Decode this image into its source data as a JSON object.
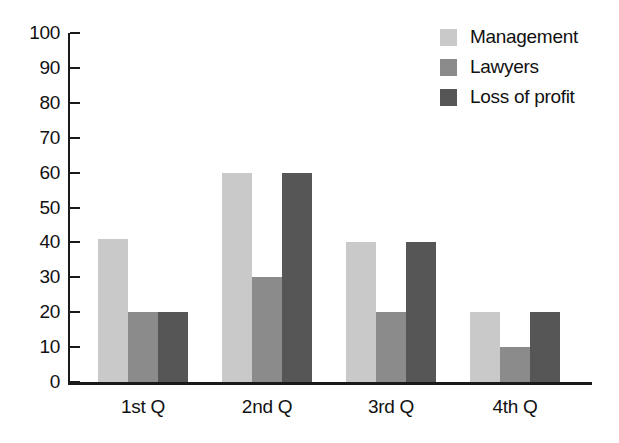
{
  "chart_data": {
    "type": "bar",
    "title": "",
    "subtitle": "",
    "xlabel": "",
    "ylabel": "",
    "categories": [
      "1st Q",
      "2nd Q",
      "3rd Q",
      "4th Q"
    ],
    "series": [
      {
        "name": "Management",
        "color": "#c9c9c9",
        "values": [
          41,
          60,
          40,
          20
        ]
      },
      {
        "name": "Lawyers",
        "color": "#8b8b8b",
        "values": [
          20,
          30,
          20,
          10
        ]
      },
      {
        "name": "Loss of profit",
        "color": "#565656",
        "values": [
          20,
          60,
          40,
          20
        ]
      }
    ],
    "ylim": [
      0,
      100
    ],
    "ytick_labels": [
      "100",
      "90",
      "80",
      "70",
      "60",
      "50",
      "40",
      "30",
      "20",
      "10",
      "0"
    ],
    "ytick_values": [
      100,
      90,
      80,
      70,
      60,
      50,
      40,
      30,
      20,
      10,
      0
    ],
    "grid": false,
    "legend_position": "top-right",
    "axis_color": "#1a1a1a",
    "background_color": "#ffffff"
  },
  "legend": {
    "items": [
      {
        "label": "Management"
      },
      {
        "label": "Lawyers"
      },
      {
        "label": "Loss of profit"
      }
    ]
  }
}
